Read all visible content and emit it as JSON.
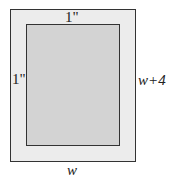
{
  "diagram": {
    "top_margin_label": "1\"",
    "left_margin_label": "1\"",
    "height_label": "w+4",
    "width_label": "w",
    "colors": {
      "outer_fill": "#ececec",
      "inner_fill": "#d3d3d3",
      "stroke": "#333333"
    }
  }
}
